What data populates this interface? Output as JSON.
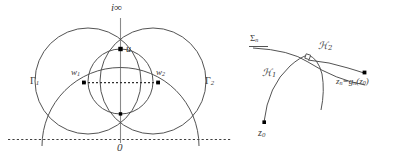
{
  "figure": {
    "background_color": "#ffffff",
    "stroke_color": "#3f3f3f",
    "dash_color": "#3f3f3f",
    "point_color": "#000000",
    "axis_color": "#7a7a7a"
  },
  "left_panel": {
    "name": "intersecting-circles-panel",
    "labels": {
      "infinity": "i∞",
      "origin": "0",
      "apex_point": "u",
      "gamma_1": "Γ",
      "gamma_1_sub": "1",
      "gamma_2": "Γ",
      "gamma_2_sub": "2",
      "w_1": "w",
      "w_1_sub": "1",
      "w_2": "w",
      "w_2_sub": "2"
    },
    "elements": {
      "vertical_axis": "imaginary-axis",
      "horizontal_dashed_axis": "real-axis",
      "circle_left": "gamma-1-circle",
      "circle_right": "gamma-2-circle",
      "wide_arc": "horocycle-arc-through-w1-w2",
      "lens_left": "lens-arc-left",
      "lens_right": "lens-arc-right",
      "dashed_segment": "dashed-segment-w1-w2"
    }
  },
  "right_panel": {
    "name": "geodesic-arcs-panel",
    "labels": {
      "sigma": "Σ",
      "sigma_sub": "n",
      "h_one": "ℋ",
      "h_one_sub": "1",
      "h_two": "ℋ",
      "h_two_sub": "2",
      "z_start": "z",
      "z_start_sub": "0",
      "z_image": "z",
      "z_image_sub": "n",
      "z_image_eq": "=g",
      "z_image_eq_sub": "n",
      "z_image_arg": "(z",
      "z_image_arg_sub": "0",
      "z_image_close": ")"
    },
    "elements": {
      "sigma_arc": "sigma-n-arc",
      "h1_arc": "h1-geodesic-arc",
      "h2_arc": "h2-geodesic-arc",
      "right_angle_marker": "perpendicular-marker",
      "point_z0": "point-z0",
      "point_zn": "point-zn",
      "sigma_tail": "sigma-straight-tail"
    }
  }
}
